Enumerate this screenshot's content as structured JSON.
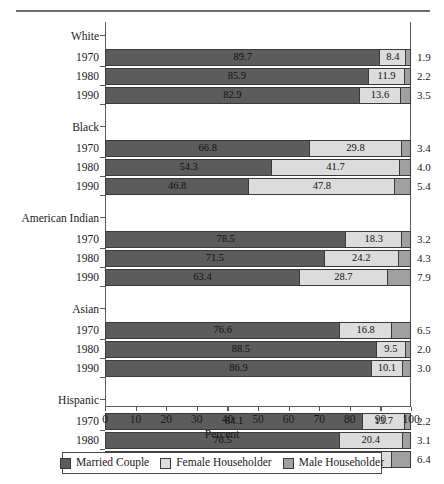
{
  "chart_data": {
    "type": "bar",
    "subtype": "stacked-horizontal-bar",
    "title": "",
    "xlabel": "Percent",
    "ylabel": "",
    "xlim": [
      0,
      100
    ],
    "xticks": [
      0,
      10,
      20,
      30,
      40,
      50,
      60,
      70,
      80,
      90,
      100
    ],
    "xtick_labels": [
      "0",
      "10",
      "20",
      "30",
      "40",
      "50",
      "60",
      "70",
      "80",
      "90",
      "100"
    ],
    "grid": false,
    "legend_position": "bottom",
    "series": [
      {
        "name": "Married Couple",
        "color": "#5c5c5c",
        "values": [
          89.7,
          85.9,
          82.9,
          66.8,
          54.3,
          46.8,
          78.5,
          71.5,
          63.4,
          76.6,
          88.5,
          86.9,
          84.1,
          76.5,
          71.4
        ]
      },
      {
        "name": "Female Householder",
        "color": "#dcdcdc",
        "values": [
          8.4,
          11.9,
          13.6,
          29.8,
          41.7,
          47.8,
          18.3,
          24.2,
          28.7,
          16.8,
          9.5,
          10.1,
          13.7,
          20.4,
          22.2
        ]
      },
      {
        "name": "Male Householder",
        "color": "#a0a0a0",
        "values": [
          1.9,
          2.2,
          3.5,
          3.4,
          4.0,
          5.4,
          3.2,
          4.3,
          7.9,
          6.5,
          2.0,
          3.0,
          2.2,
          3.1,
          6.4
        ]
      }
    ],
    "categories": [
      "White 1970",
      "White 1980",
      "White 1990",
      "Black 1970",
      "Black 1980",
      "Black 1990",
      "American Indian 1970",
      "American Indian 1980",
      "American Indian 1990",
      "Asian 1970",
      "Asian 1980",
      "Asian 1990",
      "Hispanic 1970",
      "Hispanic 1980",
      "Hispanic 1990"
    ],
    "groups": [
      {
        "label": "White",
        "rows": [
          {
            "year": "1970",
            "married": "89.7",
            "female": "8.4",
            "male": "1.9"
          },
          {
            "year": "1980",
            "married": "85.9",
            "female": "11.9",
            "male": "2.2"
          },
          {
            "year": "1990",
            "married": "82.9",
            "female": "13.6",
            "male": "3.5"
          }
        ]
      },
      {
        "label": "Black",
        "rows": [
          {
            "year": "1970",
            "married": "66.8",
            "female": "29.8",
            "male": "3.4"
          },
          {
            "year": "1980",
            "married": "54.3",
            "female": "41.7",
            "male": "4.0"
          },
          {
            "year": "1990",
            "married": "46.8",
            "female": "47.8",
            "male": "5.4"
          }
        ]
      },
      {
        "label": "American Indian",
        "rows": [
          {
            "year": "1970",
            "married": "78.5",
            "female": "18.3",
            "male": "3.2"
          },
          {
            "year": "1980",
            "married": "71.5",
            "female": "24.2",
            "male": "4.3"
          },
          {
            "year": "1990",
            "married": "63.4",
            "female": "28.7",
            "male": "7.9"
          }
        ]
      },
      {
        "label": "Asian",
        "rows": [
          {
            "year": "1970",
            "married": "76.6",
            "female": "16.8",
            "male": "6.5"
          },
          {
            "year": "1980",
            "married": "88.5",
            "female": "9.5",
            "male": "2.0"
          },
          {
            "year": "1990",
            "married": "86.9",
            "female": "10.1",
            "male": "3.0"
          }
        ]
      },
      {
        "label": "Hispanic",
        "rows": [
          {
            "year": "1970",
            "married": "84.1",
            "female": "13.7",
            "male": "2.2"
          },
          {
            "year": "1980",
            "married": "76.5",
            "female": "20.4",
            "male": "3.1"
          },
          {
            "year": "1990",
            "married": "71.4",
            "female": "22.2",
            "male": "6.4"
          }
        ]
      }
    ],
    "legend": [
      {
        "label": "Married Couple",
        "color": "#5c5c5c"
      },
      {
        "label": "Female Householder",
        "color": "#dcdcdc"
      },
      {
        "label": "Male Householder",
        "color": "#a0a0a0"
      }
    ]
  }
}
